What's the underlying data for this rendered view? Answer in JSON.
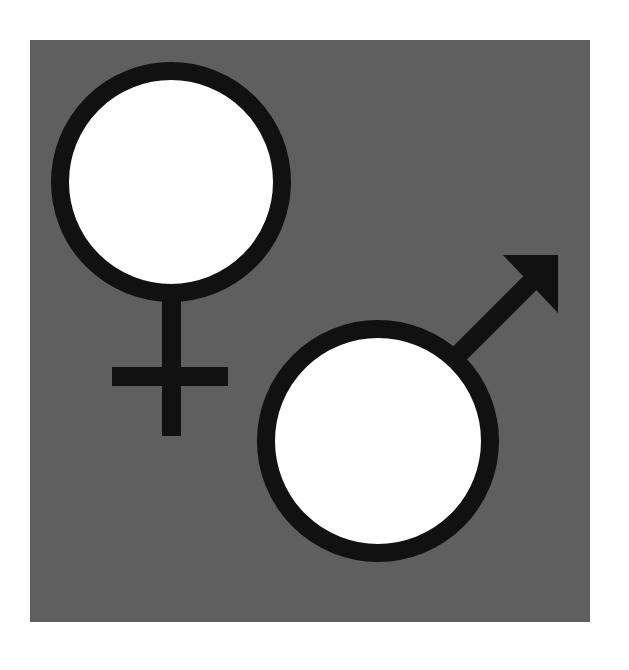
{
  "image": {
    "description": "Female and male gender symbols on a gray square",
    "background_color": "#ffffff",
    "panel_color": "#5f5f5f",
    "symbol_stroke_color": "#111111",
    "symbol_fill_color": "#ffffff"
  },
  "symbols": [
    {
      "name": "female",
      "icon": "venus-symbol"
    },
    {
      "name": "male",
      "icon": "mars-symbol"
    }
  ]
}
